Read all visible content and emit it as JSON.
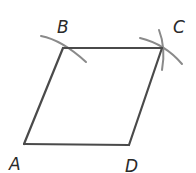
{
  "diagram": {
    "type": "rhombus-construction",
    "colors": {
      "edge": "#4a4a4a",
      "arc": "#8a8a8a",
      "label": "#2a2a2a"
    },
    "vertices": [
      {
        "label": "A",
        "x": 24,
        "y": 144
      },
      {
        "label": "B",
        "x": 63,
        "y": 48
      },
      {
        "label": "C",
        "x": 162,
        "y": 48
      },
      {
        "label": "D",
        "x": 129,
        "y": 145
      }
    ],
    "labels": {
      "A": "A",
      "B": "B",
      "C": "C",
      "D": "D"
    },
    "edges": [
      "AB",
      "BC",
      "CD",
      "DA"
    ],
    "construction_arcs": [
      "arc through B",
      "arc through C (from B)",
      "arc through C (from D)"
    ]
  }
}
